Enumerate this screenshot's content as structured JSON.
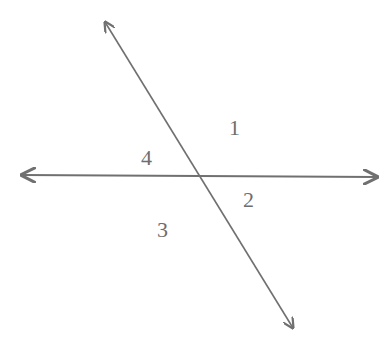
{
  "diagram": {
    "type": "intersecting-lines",
    "line_color": "#707070",
    "label_color": "#6e6e6e",
    "lines": [
      {
        "name": "horizontal-line",
        "x1": 22,
        "y1": 175,
        "x2": 377,
        "y2": 177,
        "arrows": "both"
      },
      {
        "name": "transversal-line",
        "x1": 105,
        "y1": 22,
        "x2": 293,
        "y2": 328,
        "arrows": "both"
      }
    ],
    "angle_labels": [
      {
        "text": "1",
        "x": 229,
        "y": 117
      },
      {
        "text": "2",
        "x": 243,
        "y": 189
      },
      {
        "text": "3",
        "x": 157,
        "y": 219
      },
      {
        "text": "4",
        "x": 141,
        "y": 147
      }
    ]
  }
}
